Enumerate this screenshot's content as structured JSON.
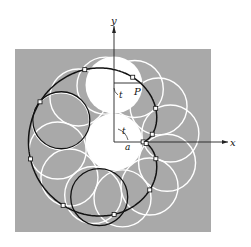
{
  "figure": {
    "type": "cardioid rolling-circle construction",
    "labels": {
      "x_axis": "x",
      "y_axis": "y",
      "point": "P",
      "angle_top": "t",
      "angle_center": "t",
      "radius": "a"
    },
    "colors": {
      "panel": "#a9a9a9",
      "curve": "#111111",
      "circles": "#ffffff",
      "background": "#ffffff"
    },
    "geometry": {
      "origin_px": [
        114,
        142
      ],
      "a_px": 28.5,
      "panel_px": [
        15,
        49,
        211,
        232
      ],
      "rolling_circle_count": 12,
      "marked_points": 12
    }
  }
}
